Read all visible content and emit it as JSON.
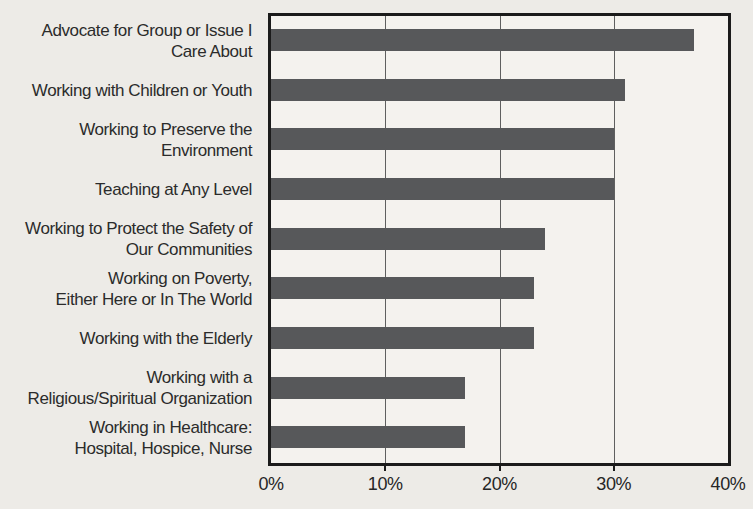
{
  "chart_data": {
    "type": "bar",
    "orientation": "horizontal",
    "title": "",
    "xlabel": "",
    "ylabel": "",
    "xlim": [
      0,
      40
    ],
    "unit": "%",
    "grid": true,
    "legend": false,
    "x_ticks": [
      {
        "label": "0%",
        "value": 0
      },
      {
        "label": "10%",
        "value": 10
      },
      {
        "label": "20%",
        "value": 20
      },
      {
        "label": "30%",
        "value": 30
      },
      {
        "label": "40%",
        "value": 40
      }
    ],
    "bars": [
      {
        "label_lines": [
          "Advocate for Group or Issue I",
          "Care About"
        ],
        "value": 37
      },
      {
        "label_lines": [
          "Working with Children or Youth"
        ],
        "value": 31
      },
      {
        "label_lines": [
          "Working to Preserve the",
          "Environment"
        ],
        "value": 30
      },
      {
        "label_lines": [
          "Teaching at Any Level"
        ],
        "value": 30
      },
      {
        "label_lines": [
          "Working to Protect the Safety of",
          "Our Communities"
        ],
        "value": 24
      },
      {
        "label_lines": [
          "Working on Poverty,",
          "Either Here or In The World"
        ],
        "value": 23
      },
      {
        "label_lines": [
          "Working with the Elderly"
        ],
        "value": 23
      },
      {
        "label_lines": [
          "Working with a",
          "Religious/Spiritual Organization"
        ],
        "value": 17
      },
      {
        "label_lines": [
          "Working in Healthcare:",
          "Hospital, Hospice, Nurse"
        ],
        "value": 17
      }
    ]
  },
  "colors": {
    "bar": "#57585a",
    "page_background": "#edebe7",
    "plot_background": "#f4f2ee",
    "border": "#1b1b1b",
    "gridline": "#5f5f5f",
    "text": "#2b2b2b"
  }
}
